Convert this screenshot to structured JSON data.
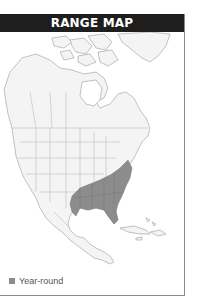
{
  "header": {
    "title": "RANGE MAP"
  },
  "legend": {
    "items": [
      {
        "label": "Year-round",
        "color": "#8c8c8c"
      }
    ]
  },
  "colors": {
    "header_bg": "#1e1e1e",
    "land": "#f4f4f4",
    "borders": "#9a9a9a",
    "range_year_round": "#8c8c8c",
    "water": "#ffffff"
  },
  "map": {
    "region": "North America",
    "range_description": "Southeastern United States"
  }
}
